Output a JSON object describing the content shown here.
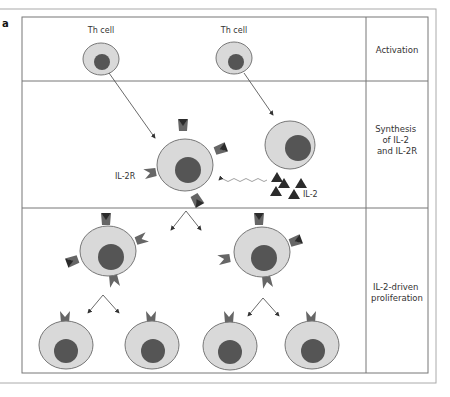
{
  "figure": {
    "panel_label": "a",
    "colors": {
      "cell_fill": "#d9d9d9",
      "cell_stroke": "#777777",
      "nucleus": "#555555",
      "receptor": "#666666",
      "il2": "#2b2b2b",
      "line": "#555555"
    },
    "rows": [
      {
        "stage_lines": [
          "Activation"
        ]
      },
      {
        "stage_lines": [
          "Synthesis",
          "of IL-2",
          "and IL-2R"
        ]
      },
      {
        "stage_lines": [
          "IL-2-driven",
          "proliferation"
        ]
      }
    ],
    "labels": {
      "th_cell_left": "Th cell",
      "th_cell_right": "Th cell",
      "il2r": "IL-2R",
      "il2": "IL-2"
    }
  }
}
